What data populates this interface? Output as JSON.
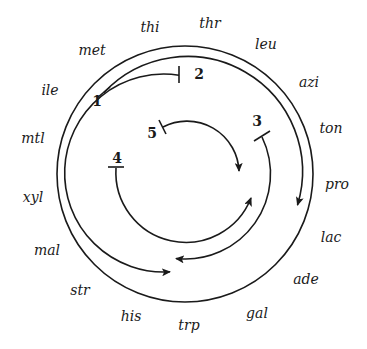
{
  "diagram": {
    "type": "circular chromosome map (E. coli Hfr transfer origins)",
    "genes": [
      {
        "label": "thi",
        "x": 150,
        "y": 32
      },
      {
        "label": "thr",
        "x": 210,
        "y": 28
      },
      {
        "label": "leu",
        "x": 266,
        "y": 49
      },
      {
        "label": "azi",
        "x": 309,
        "y": 87
      },
      {
        "label": "ton",
        "x": 331,
        "y": 133
      },
      {
        "label": "pro",
        "x": 337,
        "y": 189
      },
      {
        "label": "lac",
        "x": 331,
        "y": 242
      },
      {
        "label": "ade",
        "x": 306,
        "y": 284
      },
      {
        "label": "gal",
        "x": 257,
        "y": 318
      },
      {
        "label": "trp",
        "x": 189,
        "y": 330
      },
      {
        "label": "his",
        "x": 131,
        "y": 321
      },
      {
        "label": "str",
        "x": 80,
        "y": 295
      },
      {
        "label": "mal",
        "x": 47,
        "y": 255
      },
      {
        "label": "xyl",
        "x": 33,
        "y": 202
      },
      {
        "label": "mtl",
        "x": 33,
        "y": 143
      },
      {
        "label": "ile",
        "x": 50,
        "y": 95
      },
      {
        "label": "met",
        "x": 92,
        "y": 55
      }
    ],
    "origins": [
      {
        "label": "1",
        "x": 97,
        "y": 106
      },
      {
        "label": "2",
        "x": 199,
        "y": 79
      },
      {
        "label": "3",
        "x": 257,
        "y": 126
      },
      {
        "label": "4",
        "x": 117,
        "y": 163
      },
      {
        "label": "5",
        "x": 152,
        "y": 138
      }
    ],
    "arcs": [
      {
        "origin": "1",
        "radius": 115,
        "direction": "clockwise",
        "end": "near pro"
      },
      {
        "origin": "2",
        "radius": 99,
        "direction": "counterclockwise",
        "end": "near his/trp"
      },
      {
        "origin": "3",
        "radius": 85,
        "direction": "clockwise",
        "end": "near trp"
      },
      {
        "origin": "4",
        "radius": 70,
        "direction": "counterclockwise",
        "end": "near lac"
      },
      {
        "origin": "5",
        "radius": 50,
        "direction": "clockwise",
        "end": "near pro"
      }
    ],
    "colors": {
      "ink": "#1a1a1a",
      "background": "#ffffff"
    }
  }
}
